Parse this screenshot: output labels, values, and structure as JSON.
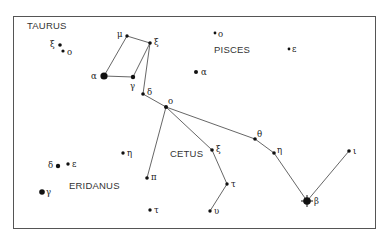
{
  "chart_data": {
    "type": "diagram",
    "constellations": [
      {
        "name": "TAURUS",
        "x": 27,
        "y": 20
      },
      {
        "name": "PISCES",
        "x": 214,
        "y": 44
      },
      {
        "name": "CETUS",
        "x": 170,
        "y": 148
      },
      {
        "name": "ERIDANUS",
        "x": 69,
        "y": 180
      }
    ],
    "stars": [
      {
        "id": "tau_xi",
        "label": "ξ",
        "x": 60,
        "y": 45,
        "r": 1.8,
        "lx": 50,
        "ly": 40
      },
      {
        "id": "tau_o",
        "label": "o",
        "x": 63,
        "y": 51,
        "r": 1.6,
        "lx": 67,
        "ly": 48
      },
      {
        "id": "cet_mu",
        "label": "μ",
        "x": 127,
        "y": 36,
        "r": 1.7,
        "lx": 117,
        "ly": 30
      },
      {
        "id": "cet_xi2",
        "label": "ξ",
        "x": 150,
        "y": 43,
        "r": 1.8,
        "lx": 154,
        "ly": 38
      },
      {
        "id": "cet_alpha",
        "label": "α",
        "x": 104,
        "y": 76,
        "r": 3.6,
        "lx": 91,
        "ly": 72
      },
      {
        "id": "cet_gamma",
        "label": "γ",
        "x": 133,
        "y": 77,
        "r": 2.2,
        "lx": 130,
        "ly": 82
      },
      {
        "id": "cet_delta",
        "label": "δ",
        "x": 143,
        "y": 94,
        "r": 1.8,
        "lx": 147,
        "ly": 88
      },
      {
        "id": "cet_o",
        "label": "o",
        "x": 166,
        "y": 107,
        "r": 2.0,
        "lx": 168,
        "ly": 97
      },
      {
        "id": "cet_pi",
        "label": "π",
        "x": 147,
        "y": 178,
        "r": 1.8,
        "lx": 151,
        "ly": 173
      },
      {
        "id": "cet_xi1",
        "label": "ξ",
        "x": 212,
        "y": 150,
        "r": 1.8,
        "lx": 216,
        "ly": 145
      },
      {
        "id": "cet_tau",
        "label": "τ",
        "x": 227,
        "y": 184,
        "r": 1.7,
        "lx": 231,
        "ly": 180
      },
      {
        "id": "cet_upsilon",
        "label": "υ",
        "x": 210,
        "y": 211,
        "r": 1.7,
        "lx": 214,
        "ly": 207
      },
      {
        "id": "cet_theta",
        "label": "θ",
        "x": 255,
        "y": 139,
        "r": 1.8,
        "lx": 257,
        "ly": 130
      },
      {
        "id": "cet_eta",
        "label": "η",
        "x": 274,
        "y": 153,
        "r": 1.8,
        "lx": 277,
        "ly": 146
      },
      {
        "id": "cet_beta",
        "label": "β",
        "x": 307,
        "y": 201,
        "r": 3.8,
        "lx": 314,
        "ly": 197
      },
      {
        "id": "cet_iota",
        "label": "ι",
        "x": 349,
        "y": 151,
        "r": 1.8,
        "lx": 353,
        "ly": 147
      },
      {
        "id": "psc_o",
        "label": "o",
        "x": 215,
        "y": 33,
        "r": 1.4,
        "lx": 218,
        "ly": 30
      },
      {
        "id": "psc_epsilon",
        "label": "ε",
        "x": 289,
        "y": 49,
        "r": 1.4,
        "lx": 292,
        "ly": 45
      },
      {
        "id": "psc_alpha",
        "label": "α",
        "x": 196,
        "y": 72,
        "r": 2.0,
        "lx": 201,
        "ly": 68
      },
      {
        "id": "eri_delta",
        "label": "δ",
        "x": 58,
        "y": 166,
        "r": 2.2,
        "lx": 48,
        "ly": 161
      },
      {
        "id": "eri_epsilon",
        "label": "ε",
        "x": 68,
        "y": 164,
        "r": 1.7,
        "lx": 72,
        "ly": 160
      },
      {
        "id": "eri_eta",
        "label": "η",
        "x": 123,
        "y": 153,
        "r": 1.7,
        "lx": 127,
        "ly": 149
      },
      {
        "id": "eri_gamma",
        "label": "γ",
        "x": 42,
        "y": 192,
        "r": 2.8,
        "lx": 46,
        "ly": 188
      },
      {
        "id": "eri_tau",
        "label": "τ",
        "x": 150,
        "y": 210,
        "r": 1.7,
        "lx": 154,
        "ly": 206
      }
    ],
    "lines": [
      [
        "cet_alpha",
        "cet_mu"
      ],
      [
        "cet_mu",
        "cet_xi2"
      ],
      [
        "cet_xi2",
        "cet_gamma"
      ],
      [
        "cet_alpha",
        "cet_gamma"
      ],
      [
        "cet_xi2",
        "cet_delta"
      ],
      [
        "cet_delta",
        "cet_o"
      ],
      [
        "cet_o",
        "cet_pi"
      ],
      [
        "cet_o",
        "cet_xi1"
      ],
      [
        "cet_xi1",
        "cet_tau"
      ],
      [
        "cet_tau",
        "cet_upsilon"
      ],
      [
        "cet_o",
        "cet_theta"
      ],
      [
        "cet_theta",
        "cet_eta"
      ],
      [
        "cet_eta",
        "cet_beta"
      ],
      [
        "cet_beta",
        "cet_iota"
      ]
    ]
  }
}
